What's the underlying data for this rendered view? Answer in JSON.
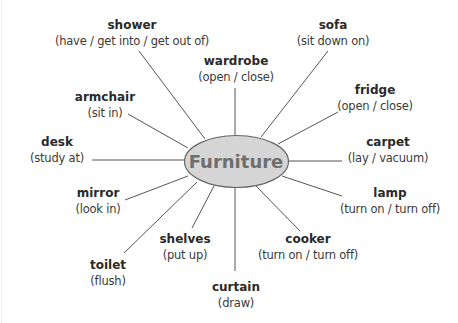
{
  "diagram": {
    "type": "mind-map",
    "center": {
      "label": "Furniture",
      "fill": "#d5d5d5",
      "stroke": "#666666",
      "text_color": "#6e6e6e"
    },
    "nodes": [
      {
        "word": "shower",
        "verbs": "(have / get into / get out of)"
      },
      {
        "word": "sofa",
        "verbs": "(sit down on)"
      },
      {
        "word": "wardrobe",
        "verbs": "(open / close)"
      },
      {
        "word": "fridge",
        "verbs": "(open / close)"
      },
      {
        "word": "armchair",
        "verbs": "(sit in)"
      },
      {
        "word": "carpet",
        "verbs": "(lay / vacuum)"
      },
      {
        "word": "desk",
        "verbs": "(study at)"
      },
      {
        "word": "lamp",
        "verbs": "(turn on / turn off)"
      },
      {
        "word": "mirror",
        "verbs": "(look in)"
      },
      {
        "word": "cooker",
        "verbs": "(turn on / turn off)"
      },
      {
        "word": "shelves",
        "verbs": "(put up)"
      },
      {
        "word": "toilet",
        "verbs": "(flush)"
      },
      {
        "word": "curtain",
        "verbs": "(draw)"
      }
    ],
    "line_color": "#555555"
  }
}
